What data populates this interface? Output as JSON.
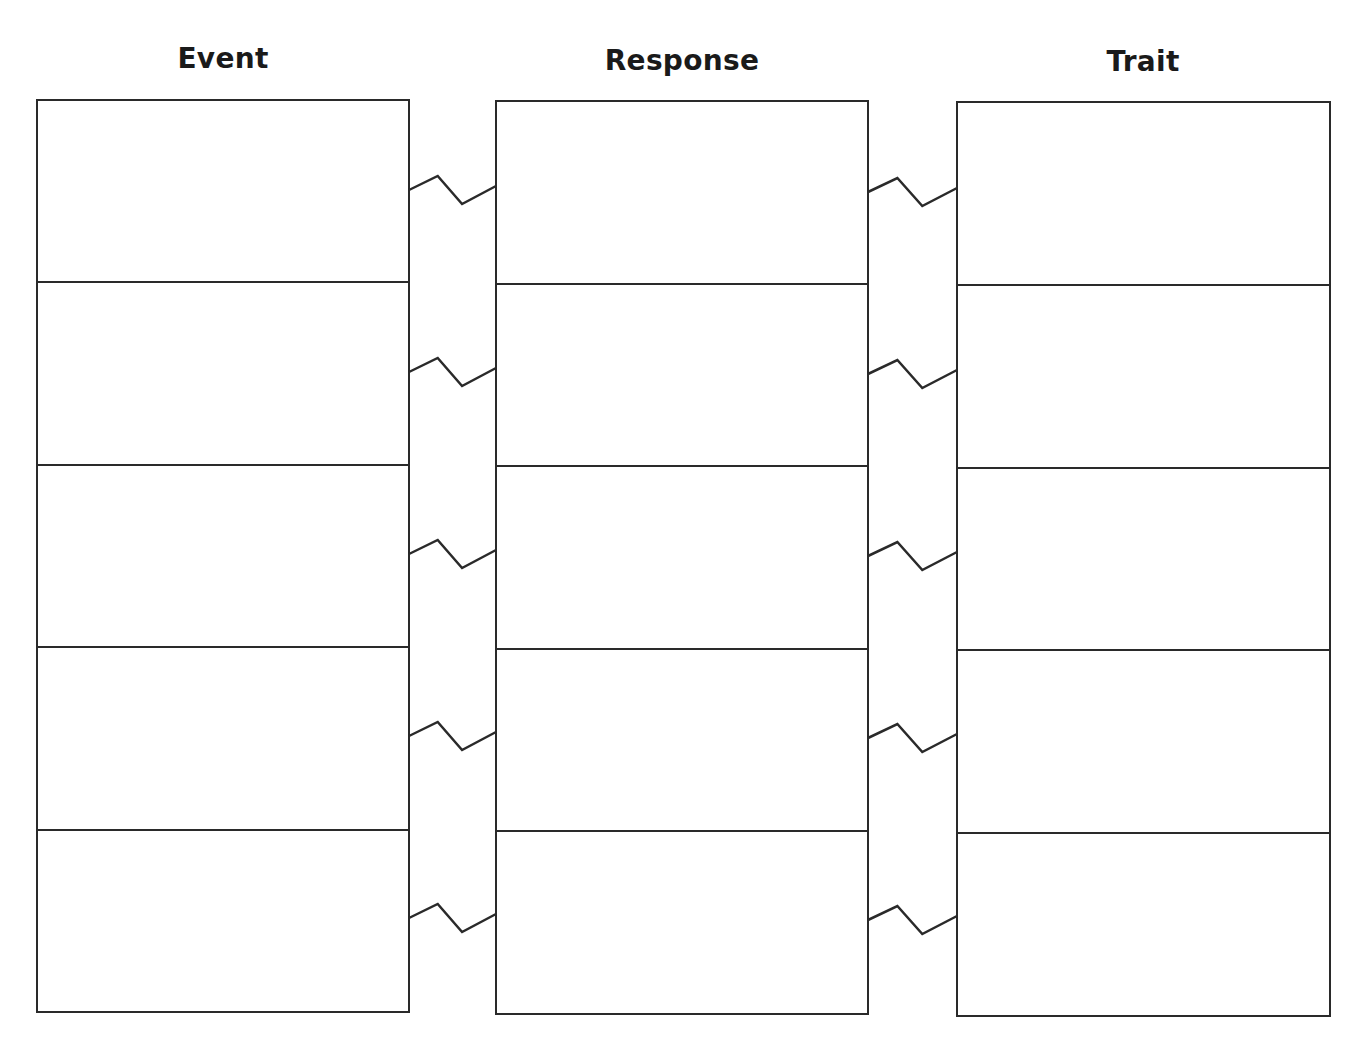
{
  "worksheet": {
    "columns": [
      {
        "heading": "Event",
        "rows": [
          "",
          "",
          "",
          "",
          ""
        ]
      },
      {
        "heading": "Response",
        "rows": [
          "",
          "",
          "",
          "",
          ""
        ]
      },
      {
        "heading": "Trait",
        "rows": [
          "",
          "",
          "",
          "",
          ""
        ]
      }
    ],
    "connector_icon": "zigzag-connector",
    "line_color": "#2a2a2a"
  }
}
